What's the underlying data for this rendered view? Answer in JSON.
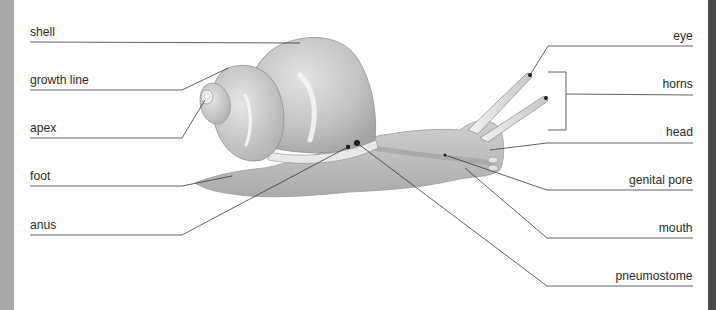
{
  "diagram": {
    "left_labels": [
      {
        "id": "shell",
        "text": "shell",
        "y": 30
      },
      {
        "id": "growth-line",
        "text": "growth line",
        "y": 73
      },
      {
        "id": "apex",
        "text": "apex",
        "y": 120
      },
      {
        "id": "foot",
        "text": "foot",
        "y": 168
      },
      {
        "id": "anus",
        "text": "anus",
        "y": 216
      }
    ],
    "right_labels": [
      {
        "id": "eye",
        "text": "eye",
        "y": 30
      },
      {
        "id": "horns",
        "text": "horns",
        "y": 77
      },
      {
        "id": "head",
        "text": "head",
        "y": 125
      },
      {
        "id": "genital-pore",
        "text": "genital pore",
        "y": 172
      },
      {
        "id": "mouth",
        "text": "mouth",
        "y": 220
      },
      {
        "id": "pneumostome",
        "text": "pneumostome",
        "y": 267
      }
    ],
    "colors": {
      "leader_line": "#3a3a3a",
      "body": "#b9b9b9",
      "shell_light": "#d8d8d8",
      "shell_dark": "#a8a8a8",
      "edge_left": "#a9a9a9",
      "edge_right": "#4a4a4a"
    }
  }
}
